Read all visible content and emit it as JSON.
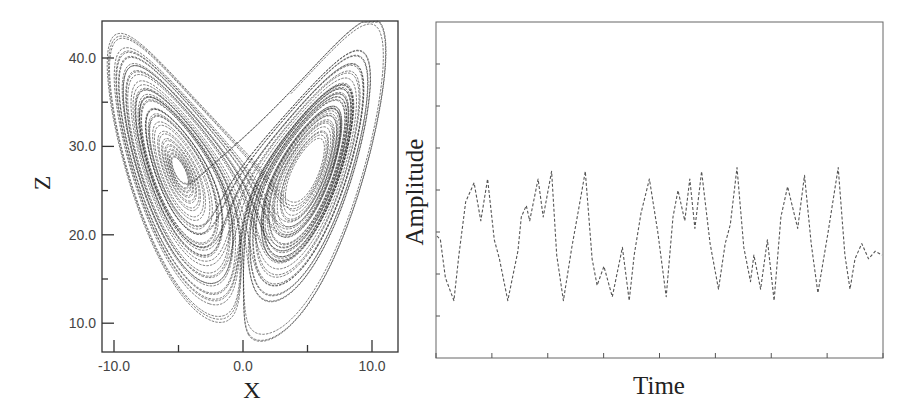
{
  "chart_data": [
    {
      "type": "line",
      "title": "",
      "description": "Lorenz attractor projected onto the X–Z plane (butterfly shape, two lobes)",
      "xlabel": "X",
      "ylabel": "Z",
      "xlim": [
        -11.0,
        12.0
      ],
      "ylim": [
        6.5,
        44.0
      ],
      "xticks": [
        -10.0,
        0.0,
        10.0
      ],
      "xtick_labels": [
        "-10.0",
        "0.0",
        "10.0"
      ],
      "x_minor_ticks": [
        -5.0,
        5.0
      ],
      "yticks": [
        10.0,
        20.0,
        30.0,
        40.0
      ],
      "ytick_labels": [
        "10.0",
        "20.0",
        "30.0",
        "40.0"
      ],
      "y_minor_ticks": [
        15.0,
        25.0,
        35.0
      ],
      "grid": false,
      "legend": null,
      "lobes": [
        {
          "name": "left lobe",
          "center_x": -6.5,
          "center_z": 27.0,
          "outer_x_min": -10.5,
          "outer_z_max": 43.5
        },
        {
          "name": "right lobe",
          "center_x": 6.5,
          "center_z": 27.0,
          "outer_x_max": 10.5,
          "outer_z_max": 44.0
        }
      ]
    },
    {
      "type": "line",
      "title": "",
      "description": "Chaotic time series of one Lorenz variable vs. time",
      "xlabel": "Time",
      "ylabel": "Amplitude",
      "x_tick_count": 9,
      "y_tick_count": 9,
      "xtick_labels": [],
      "ytick_labels": [],
      "grid": false,
      "legend": null,
      "series": [
        {
          "name": "amplitude",
          "x": [
            0,
            2,
            5,
            10,
            13,
            17,
            22,
            26,
            30,
            34,
            37,
            42,
            48,
            50,
            53,
            55,
            60,
            63,
            68,
            71,
            75,
            80,
            84,
            88,
            92,
            95,
            99,
            104,
            110,
            114,
            117,
            121,
            126,
            131,
            136,
            140,
            143,
            147,
            150,
            153,
            157,
            162,
            167,
            171,
            174,
            178,
            182,
            186,
            188,
            192,
            196,
            200,
            204,
            208,
            214,
            218,
            222,
            226,
            232,
            238,
            242,
            245,
            248,
            252,
            256,
            260,
            264
          ],
          "values": [
            0.0,
            -0.1,
            -1.1,
            -1.7,
            -0.5,
            0.9,
            1.4,
            0.4,
            1.5,
            -0.1,
            -0.6,
            -1.7,
            -0.4,
            0.5,
            0.8,
            0.4,
            1.5,
            0.5,
            1.7,
            -0.5,
            -1.7,
            -0.3,
            0.7,
            1.7,
            -0.6,
            -1.3,
            -0.8,
            -1.6,
            -0.3,
            -1.7,
            -0.5,
            0.6,
            1.5,
            0.1,
            -1.6,
            0.5,
            1.2,
            0.4,
            1.5,
            0.2,
            1.7,
            -0.2,
            -1.4,
            -0.2,
            0.3,
            1.8,
            -0.3,
            -1.2,
            -0.5,
            -1.4,
            -0.1,
            -1.7,
            0.5,
            1.3,
            0.2,
            1.6,
            -0.2,
            -1.5,
            0.1,
            1.8,
            -0.5,
            -1.4,
            -0.6,
            -0.2,
            -0.6,
            -0.4,
            -0.5
          ]
        }
      ]
    }
  ]
}
